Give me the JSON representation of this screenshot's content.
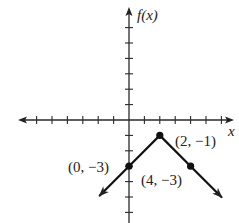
{
  "chart_data": {
    "type": "line",
    "title": "",
    "xlabel": "x",
    "ylabel": "f(x)",
    "xlim": [
      -7,
      7
    ],
    "ylim": [
      -6.5,
      7
    ],
    "x_ticks": [
      -6,
      -5,
      -4,
      -3,
      -2,
      -1,
      1,
      2,
      3,
      4,
      5,
      6
    ],
    "y_ticks": [
      -6,
      -5,
      -4,
      -3,
      -2,
      -1,
      1,
      2,
      3,
      4,
      5,
      6
    ],
    "grid": false,
    "series": [
      {
        "name": "f(x)",
        "description": "Inverted V (absolute value) graph with vertex at (2, -1), extending with arrows",
        "x": [
          -1.9,
          0,
          2,
          4,
          6
        ],
        "y": [
          -4.9,
          -3,
          -1,
          -3,
          -5
        ]
      }
    ],
    "points": [
      {
        "x": 0,
        "y": -3,
        "label": "(0, −3)"
      },
      {
        "x": 2,
        "y": -1,
        "label": "(2, −1)"
      },
      {
        "x": 4,
        "y": -3,
        "label": "(4, −3)"
      }
    ],
    "colors": {
      "line": "#111111",
      "axis": "#2a2a2a",
      "background": "#ffffff"
    }
  },
  "labels": {
    "x_axis": "x",
    "y_axis": "f(x)",
    "p0": "(0, −3)",
    "p1": "(2, −1)",
    "p2": "(4, −3)"
  }
}
